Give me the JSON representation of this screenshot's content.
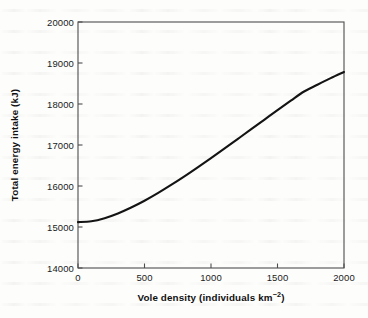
{
  "figure": {
    "background_color": "#fdfdfc",
    "frame_color": "#4d4d4d",
    "curve_color": "#141414"
  },
  "chart_data": {
    "type": "line",
    "title": "",
    "subtitle": "",
    "xlabel_plain": "Vole density (individuals km-2)",
    "xlabel_main": "Vole density (individuals km",
    "xlabel_exponent": "−2",
    "xlabel_close": ")",
    "ylabel": "Total energy intake (kJ)",
    "xlim": [
      0,
      2000
    ],
    "ylim": [
      14000,
      20000
    ],
    "xticks": [
      0,
      500,
      1000,
      1500,
      2000
    ],
    "xtick_labels": [
      "0",
      "500",
      "1000",
      "1500",
      "2000"
    ],
    "yticks": [
      14000,
      15000,
      16000,
      17000,
      18000,
      19000,
      20000
    ],
    "ytick_labels": [
      "14000",
      "15000",
      "16000",
      "17000",
      "18000",
      "19000",
      "20000"
    ],
    "grid": false,
    "legend": false,
    "legend_position": "none",
    "tick_direction": "in",
    "series": [
      {
        "name": "Total energy intake",
        "x": [
          0,
          100,
          200,
          300,
          400,
          500,
          600,
          700,
          800,
          900,
          1000,
          1100,
          1200,
          1300,
          1400,
          1500,
          1600,
          1700,
          1800,
          1900,
          2000
        ],
        "y": [
          15120,
          15140,
          15215,
          15330,
          15475,
          15640,
          15825,
          16025,
          16235,
          16455,
          16680,
          16910,
          17145,
          17380,
          17615,
          17850,
          18080,
          18305,
          18470,
          18630,
          18780
        ]
      }
    ],
    "annotations": []
  }
}
